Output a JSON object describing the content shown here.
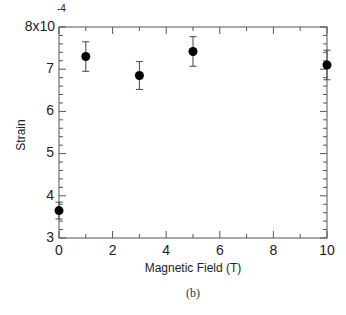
{
  "chart_data": {
    "type": "scatter",
    "title": "",
    "caption": "(b)",
    "xlabel": "Magnetic Field (T)",
    "ylabel": "Strain",
    "y_multiplier_label": "8x10",
    "y_multiplier_exponent": "-4",
    "xlim": [
      0,
      10
    ],
    "ylim": [
      3,
      8
    ],
    "x_ticks": [
      0,
      2,
      4,
      6,
      8,
      10
    ],
    "x_minor_step": 1,
    "y_ticks": [
      3,
      4,
      5,
      6,
      7
    ],
    "y_minor_step": 0.2,
    "grid": false,
    "legend": null,
    "series": [
      {
        "name": "Strain",
        "marker": "filled-circle",
        "color": "#000000",
        "points": [
          {
            "x": 0,
            "y": 3.65,
            "err": 0.2
          },
          {
            "x": 1,
            "y": 7.3,
            "err": 0.35
          },
          {
            "x": 3,
            "y": 6.85,
            "err": 0.33
          },
          {
            "x": 5,
            "y": 7.42,
            "err": 0.35
          },
          {
            "x": 10,
            "y": 7.1,
            "err": 0.35
          }
        ]
      }
    ]
  }
}
